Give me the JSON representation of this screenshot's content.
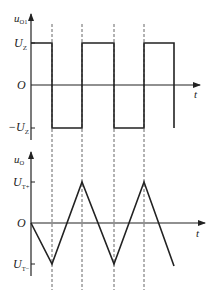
{
  "top_plot": {
    "y_label": "u",
    "y_label_sub": "O1",
    "x_label": "t",
    "origin_label": "O",
    "high_label": "U",
    "high_label_sub": "Z",
    "low_label": "−U",
    "low_label_sub": "Z",
    "waveform": "square"
  },
  "bottom_plot": {
    "y_label": "u",
    "y_label_sub": "O",
    "x_label": "t",
    "origin_label": "O",
    "high_label": "U",
    "high_label_sub": "T+",
    "low_label": "U",
    "low_label_sub": "T−",
    "waveform": "triangle"
  },
  "colors": {
    "stroke": "#222222",
    "dash": "#555555",
    "background": "#ffffff"
  },
  "geometry": {
    "y_axis_x": 31,
    "transitions_x": [
      52,
      82,
      114,
      144,
      174
    ],
    "dashed_lines_x": [
      52,
      82,
      114,
      144
    ],
    "top": {
      "axis_top": 14,
      "high_y": 43,
      "zero_y": 85,
      "low_y": 128,
      "t_end": 200
    },
    "bottom": {
      "axis_top": 152,
      "high_y": 182,
      "zero_y": 223,
      "low_y": 264,
      "t_end": 205
    }
  }
}
